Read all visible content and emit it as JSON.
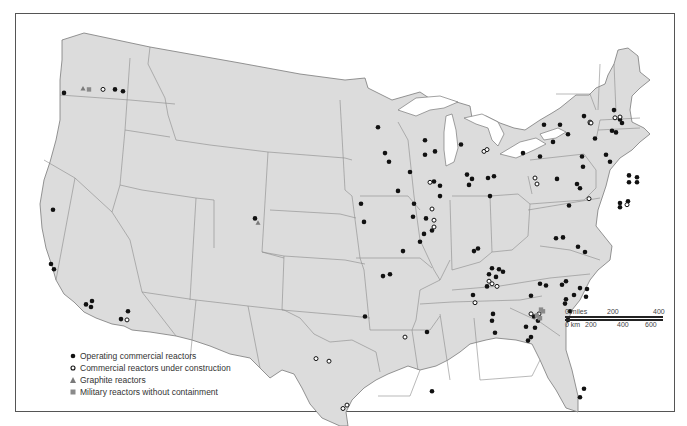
{
  "map": {
    "title": "",
    "region": "Contiguous United States",
    "colors": {
      "land": "#dcdcdc",
      "border": "#7a7a7a",
      "water": "#ffffff",
      "operating": "#111111",
      "construction_stroke": "#111111",
      "graphite": "#7a7a7a",
      "military": "#8a8a8a"
    }
  },
  "legend": {
    "items": [
      {
        "symbol": "filled-circle",
        "label": "Operating commercial reactors"
      },
      {
        "symbol": "open-circle",
        "label": "Commercial reactors under construction"
      },
      {
        "symbol": "triangle",
        "label": "Graphite reactors"
      },
      {
        "symbol": "square",
        "label": "Military reactors without containment"
      }
    ]
  },
  "scale_bar": {
    "miles_labels": [
      "0 miles",
      "200",
      "400"
    ],
    "km_labels": [
      "0 km",
      "200",
      "400",
      "600"
    ]
  },
  "markers": {
    "operating": [
      [
        64,
        108
      ],
      [
        115,
        104
      ],
      [
        123,
        106
      ],
      [
        53,
        244
      ],
      [
        51,
        307
      ],
      [
        54,
        313
      ],
      [
        86,
        354
      ],
      [
        92,
        350
      ],
      [
        91,
        357
      ],
      [
        121,
        371
      ],
      [
        128,
        362
      ],
      [
        255,
        254
      ],
      [
        378,
        148
      ],
      [
        385,
        178
      ],
      [
        389,
        188
      ],
      [
        398,
        222
      ],
      [
        361,
        237
      ],
      [
        364,
        258
      ],
      [
        403,
        292
      ],
      [
        383,
        321
      ],
      [
        390,
        319
      ],
      [
        365,
        368
      ],
      [
        425,
        163
      ],
      [
        425,
        180
      ],
      [
        435,
        176
      ],
      [
        410,
        200
      ],
      [
        434,
        211
      ],
      [
        440,
        216
      ],
      [
        440,
        228
      ],
      [
        414,
        237
      ],
      [
        413,
        252
      ],
      [
        426,
        254
      ],
      [
        424,
        272
      ],
      [
        432,
        268
      ],
      [
        420,
        281
      ],
      [
        461,
        168
      ],
      [
        467,
        203
      ],
      [
        472,
        208
      ],
      [
        469,
        215
      ],
      [
        488,
        207
      ],
      [
        494,
        205
      ],
      [
        490,
        228
      ],
      [
        474,
        292
      ],
      [
        478,
        289
      ],
      [
        473,
        343
      ],
      [
        493,
        365
      ],
      [
        427,
        386
      ],
      [
        432,
        455
      ],
      [
        523,
        178
      ],
      [
        544,
        145
      ],
      [
        560,
        145
      ],
      [
        553,
        165
      ],
      [
        540,
        182
      ],
      [
        568,
        156
      ],
      [
        577,
        214
      ],
      [
        569,
        239
      ],
      [
        580,
        219
      ],
      [
        557,
        208
      ],
      [
        582,
        182
      ],
      [
        583,
        194
      ],
      [
        584,
        135
      ],
      [
        590,
        143
      ],
      [
        595,
        161
      ],
      [
        614,
        128
      ],
      [
        612,
        152
      ],
      [
        620,
        139
      ],
      [
        622,
        143
      ],
      [
        616,
        154
      ],
      [
        606,
        180
      ],
      [
        610,
        188
      ],
      [
        629,
        204
      ],
      [
        637,
        206
      ],
      [
        629,
        212
      ],
      [
        637,
        212
      ],
      [
        620,
        236
      ],
      [
        628,
        234
      ],
      [
        620,
        241
      ],
      [
        556,
        277
      ],
      [
        563,
        276
      ],
      [
        578,
        287
      ],
      [
        585,
        293
      ],
      [
        566,
        327
      ],
      [
        580,
        335
      ],
      [
        587,
        336
      ],
      [
        562,
        331
      ],
      [
        574,
        343
      ],
      [
        586,
        345
      ],
      [
        540,
        330
      ],
      [
        546,
        332
      ],
      [
        531,
        344
      ],
      [
        534,
        368
      ],
      [
        538,
        373
      ],
      [
        526,
        380
      ],
      [
        531,
        392
      ],
      [
        535,
        381
      ],
      [
        528,
        396
      ],
      [
        499,
        313
      ],
      [
        496,
        322
      ],
      [
        492,
        312
      ],
      [
        489,
        319
      ],
      [
        487,
        333
      ],
      [
        503,
        316
      ],
      [
        492,
        373
      ],
      [
        495,
        387
      ],
      [
        566,
        348
      ],
      [
        565,
        353
      ],
      [
        570,
        362
      ],
      [
        568,
        372
      ],
      [
        580,
        462
      ],
      [
        584,
        452
      ]
    ],
    "construction": [
      [
        103,
        104
      ],
      [
        127,
        372
      ],
      [
        430,
        212
      ],
      [
        432,
        243
      ],
      [
        434,
        256
      ],
      [
        434,
        264
      ],
      [
        484,
        176
      ],
      [
        487,
        174
      ],
      [
        535,
        207
      ],
      [
        537,
        214
      ],
      [
        590,
        142
      ],
      [
        591,
        143
      ],
      [
        627,
        238
      ],
      [
        589,
        231
      ],
      [
        492,
        330
      ],
      [
        497,
        333
      ],
      [
        475,
        352
      ],
      [
        489,
        327
      ],
      [
        531,
        365
      ],
      [
        539,
        365
      ],
      [
        316,
        417
      ],
      [
        329,
        420
      ],
      [
        347,
        471
      ],
      [
        343,
        475
      ],
      [
        405,
        392
      ],
      [
        615,
        137
      ],
      [
        620,
        136
      ]
    ],
    "graphite": [
      [
        83,
        103
      ],
      [
        258,
        259
      ]
    ],
    "military": [
      [
        89,
        104
      ],
      [
        541,
        360
      ],
      [
        537,
        367
      ],
      [
        543,
        362
      ],
      [
        540,
        370
      ]
    ]
  },
  "chart_data": {
    "type": "map",
    "title": "",
    "legend": [
      "Operating commercial reactors",
      "Commercial reactors under construction",
      "Graphite reactors",
      "Military reactors without containment"
    ],
    "scale": {
      "miles": [
        0,
        200,
        400
      ],
      "km": [
        0,
        200,
        400,
        600
      ]
    },
    "categories": [
      "Operating commercial reactors",
      "Commercial reactors under construction",
      "Graphite reactors",
      "Military reactors without containment"
    ],
    "approx_counts": [
      105,
      27,
      2,
      5
    ]
  }
}
